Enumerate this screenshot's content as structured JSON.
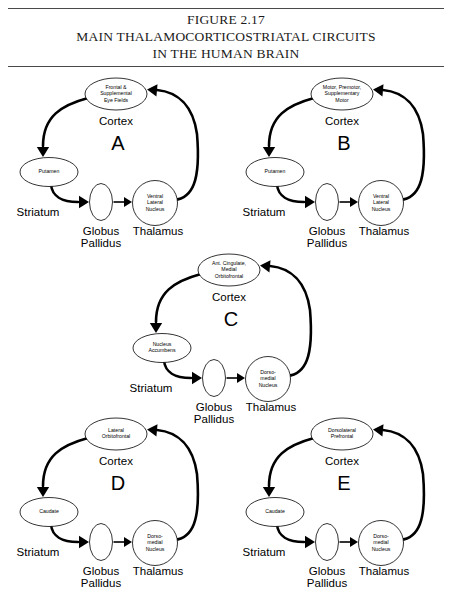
{
  "figure": {
    "rule_color": "#4a4a4a",
    "title_lines": [
      "FIGURE 2.17",
      "MAIN THALAMOCORTICOSTRIATAL CIRCUITS",
      "IN THE HUMAN BRAIN"
    ]
  },
  "shared_labels": {
    "cortex": "Cortex",
    "striatum": "Striatum",
    "globus": "Globus",
    "pallidus": "Pallidus",
    "thalamus": "Thalamus"
  },
  "circuits": [
    {
      "letter": "A",
      "cortex_lines": [
        "Frontal &",
        "Supplemental",
        "Eye Fields"
      ],
      "striatum_lines": [
        "Putamen"
      ],
      "thalamus_lines": [
        "Ventral",
        "Lateral",
        "Nucleus"
      ],
      "cortex_label": "Cortex",
      "striatum_label": "Striatum",
      "globus_label": "Globus",
      "pallidus_label": "Pallidus",
      "thalamus_label": "Thalamus"
    },
    {
      "letter": "B",
      "cortex_lines": [
        "Motor, Premotor,",
        "Supplementary",
        "Motor"
      ],
      "striatum_lines": [
        "Putamen"
      ],
      "thalamus_lines": [
        "Ventral",
        "Lateral",
        "Nucleus"
      ],
      "cortex_label": "Cortex",
      "striatum_label": "Striatum",
      "globus_label": "Globus",
      "pallidus_label": "Pallidus",
      "thalamus_label": "Thalamus"
    },
    {
      "letter": "C",
      "cortex_lines": [
        "Ant. Cingulate,",
        "Medial",
        "Orbitofrontal"
      ],
      "striatum_lines": [
        "Nucleus",
        "Accumbens"
      ],
      "thalamus_lines": [
        "Dorso-",
        "medial",
        "Nucleus"
      ],
      "cortex_label": "Cortex",
      "striatum_label": "Striatum",
      "globus_label": "Globus",
      "pallidus_label": "Pallidus",
      "thalamus_label": "Thalamus"
    },
    {
      "letter": "D",
      "cortex_lines": [
        "Lateral",
        "Orbitofrontal"
      ],
      "striatum_lines": [
        "Caudate"
      ],
      "thalamus_lines": [
        "Dorso-",
        "medial",
        "Nucleus"
      ],
      "cortex_label": "Cortex",
      "striatum_label": "Striatum",
      "globus_label": "Globus",
      "pallidus_label": "Pallidus",
      "thalamus_label": "Thalamus"
    },
    {
      "letter": "E",
      "cortex_lines": [
        "Dorsolateral",
        "Prefrontal"
      ],
      "striatum_lines": [
        "Caudate"
      ],
      "thalamus_lines": [
        "Dorso-",
        "medial",
        "Nucleus"
      ],
      "cortex_label": "Cortex",
      "striatum_label": "Striatum",
      "globus_label": "Globus",
      "pallidus_label": "Pallidus",
      "thalamus_label": "Thalamus"
    }
  ]
}
